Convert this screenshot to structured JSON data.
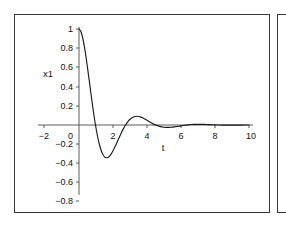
{
  "figure": {
    "panels": [
      {
        "name": "main-plot-panel"
      },
      {
        "name": "secondary-plot-panel"
      }
    ]
  },
  "chart_data": {
    "type": "line",
    "title": "",
    "subtitle": "",
    "xlabel": "t",
    "ylabel": "x1",
    "xlim": [
      -2,
      10
    ],
    "ylim": [
      -1,
      1
    ],
    "grid": false,
    "legend": "none",
    "xticks": [
      -2,
      0,
      2,
      4,
      6,
      8,
      10
    ],
    "xtick_labels": [
      "−2",
      "0",
      "2",
      "4",
      "6",
      "8",
      "10"
    ],
    "yticks": [
      -1,
      -0.8,
      -0.6,
      -0.4,
      -0.2,
      0,
      0.2,
      0.4,
      0.6,
      0.8,
      1
    ],
    "ytick_labels": [
      "−1",
      "−0.8",
      "−0.6",
      "−0.4",
      "−0.2",
      "0",
      "0.2",
      "0.4",
      "0.6",
      "0.8",
      "1"
    ],
    "annotations": [],
    "series": [
      {
        "name": "x1",
        "color": "#1a1a1a",
        "description": "damped oscillation decaying to zero",
        "x": [
          0,
          0.1,
          0.2,
          0.3,
          0.4,
          0.5,
          0.6,
          0.7,
          0.8,
          0.9,
          1.0,
          1.1,
          1.2,
          1.3,
          1.4,
          1.5,
          1.6,
          1.7,
          1.8,
          1.9,
          2.0,
          2.1,
          2.2,
          2.3,
          2.4,
          2.5,
          2.6,
          2.7,
          2.8,
          2.9,
          3.0,
          3.1,
          3.2,
          3.3,
          3.4,
          3.5,
          3.6,
          3.7,
          3.8,
          3.9,
          4.0,
          4.1,
          4.2,
          4.3,
          4.4,
          4.5,
          4.6,
          4.7,
          4.8,
          4.9,
          5.0,
          5.1,
          5.2,
          5.3,
          5.4,
          5.5,
          5.6,
          5.7,
          5.8,
          5.9,
          6.0,
          6.1,
          6.2,
          6.3,
          6.4,
          6.5,
          6.6,
          6.7,
          6.8,
          6.9,
          7.0,
          7.2,
          7.4,
          7.6,
          7.8,
          8.0,
          8.2,
          8.4,
          8.6,
          8.8,
          9.0,
          9.2,
          9.4,
          9.6,
          9.8,
          10.0
        ],
        "y": [
          1.0,
          0.978,
          0.921,
          0.834,
          0.724,
          0.599,
          0.466,
          0.331,
          0.2,
          0.078,
          -0.031,
          -0.125,
          -0.203,
          -0.263,
          -0.305,
          -0.331,
          -0.341,
          -0.338,
          -0.324,
          -0.3,
          -0.269,
          -0.233,
          -0.195,
          -0.155,
          -0.116,
          -0.078,
          -0.043,
          -0.011,
          0.017,
          0.041,
          0.06,
          0.074,
          0.084,
          0.089,
          0.091,
          0.089,
          0.085,
          0.078,
          0.069,
          0.06,
          0.049,
          0.039,
          0.028,
          0.018,
          0.009,
          0.001,
          -0.006,
          -0.012,
          -0.017,
          -0.021,
          -0.023,
          -0.025,
          -0.025,
          -0.025,
          -0.024,
          -0.022,
          -0.02,
          -0.017,
          -0.015,
          -0.012,
          -0.009,
          -0.006,
          -0.003,
          -0.001,
          0.001,
          0.003,
          0.005,
          0.006,
          0.007,
          0.007,
          0.007,
          0.007,
          0.006,
          0.004,
          0.003,
          0.001,
          0.0,
          -0.001,
          -0.002,
          -0.002,
          -0.002,
          -0.002,
          -0.001,
          -0.001,
          0.0,
          0.0
        ]
      }
    ]
  }
}
